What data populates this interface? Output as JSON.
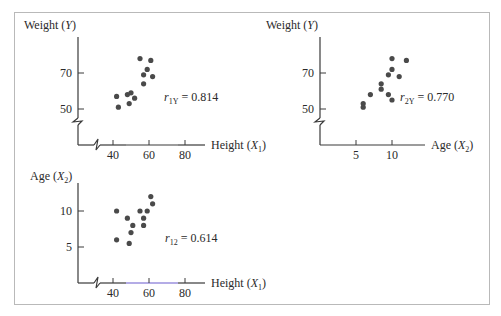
{
  "figure": {
    "frame": true,
    "axis_color": "#3a3a3a",
    "dot_color": "#4a4a4a",
    "highlight_axis_color": "#6a5acd"
  },
  "chart_data": [
    {
      "type": "scatter",
      "id": "plot1",
      "ylabel": "Weight (Y)",
      "ylabel_parts": {
        "name": "Weight",
        "var": "Y",
        "sub": ""
      },
      "xlabel": "Height (X1)",
      "xlabel_parts": {
        "name": "Height",
        "var": "X",
        "sub": "1"
      },
      "annotation": {
        "r_sub": "1Y",
        "value": "0.814",
        "text": "r1Y = 0.814"
      },
      "xticks": [
        40,
        60,
        80
      ],
      "yticks": [
        50,
        70
      ],
      "xlim": [
        20,
        90
      ],
      "ylim": [
        30,
        85
      ],
      "axis_breaks": {
        "x": true,
        "y": true
      },
      "grid": false,
      "points": [
        [
          55,
          78
        ],
        [
          61,
          77
        ],
        [
          59,
          72
        ],
        [
          57,
          69
        ],
        [
          62,
          68
        ],
        [
          57,
          64
        ],
        [
          42,
          57
        ],
        [
          48,
          58
        ],
        [
          50,
          59
        ],
        [
          52,
          56
        ],
        [
          43,
          51
        ],
        [
          49,
          53
        ]
      ]
    },
    {
      "type": "scatter",
      "id": "plot2",
      "ylabel": "Weight (Y)",
      "ylabel_parts": {
        "name": "Weight",
        "var": "Y",
        "sub": ""
      },
      "xlabel": "Age (X2)",
      "xlabel_parts": {
        "name": "Age",
        "var": "X",
        "sub": "2"
      },
      "annotation": {
        "r_sub": "2Y",
        "value": "0.770",
        "text": "r2Y = 0.770"
      },
      "xticks": [
        5,
        10
      ],
      "yticks": [
        50,
        70
      ],
      "xlim": [
        0,
        14
      ],
      "ylim": [
        30,
        85
      ],
      "axis_breaks": {
        "x": false,
        "y": true
      },
      "grid": false,
      "points": [
        [
          10,
          78
        ],
        [
          12,
          77
        ],
        [
          10,
          72
        ],
        [
          9.5,
          69
        ],
        [
          11,
          68
        ],
        [
          8.5,
          64
        ],
        [
          8.5,
          61
        ],
        [
          7,
          58
        ],
        [
          9.5,
          58
        ],
        [
          10,
          55
        ],
        [
          6,
          53
        ],
        [
          6,
          51
        ]
      ]
    },
    {
      "type": "scatter",
      "id": "plot3",
      "ylabel": "Age (X2)",
      "ylabel_parts": {
        "name": "Age",
        "var": "X",
        "sub": "2"
      },
      "xlabel": "Height (X1)",
      "xlabel_parts": {
        "name": "Height",
        "var": "X",
        "sub": "1"
      },
      "annotation": {
        "r_sub": "12",
        "value": "0.614",
        "text": "r12 = 0.614"
      },
      "xticks": [
        40,
        60,
        80
      ],
      "yticks": [
        5,
        10
      ],
      "xlim": [
        20,
        90
      ],
      "ylim": [
        0,
        14
      ],
      "axis_breaks": {
        "x": true,
        "y": false
      },
      "grid": false,
      "points": [
        [
          61,
          12
        ],
        [
          62,
          11
        ],
        [
          42,
          10
        ],
        [
          55,
          10
        ],
        [
          59,
          10
        ],
        [
          48,
          9
        ],
        [
          57,
          9
        ],
        [
          51,
          8
        ],
        [
          57,
          8
        ],
        [
          50,
          7
        ],
        [
          42,
          6
        ],
        [
          49,
          5.5
        ]
      ]
    }
  ]
}
